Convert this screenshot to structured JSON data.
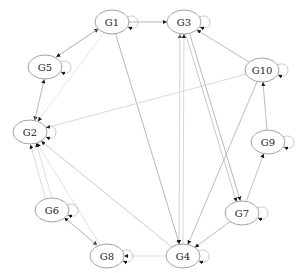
{
  "diagram": {
    "type": "directed-graph",
    "nodes": [
      {
        "id": "G1",
        "label": "G1",
        "x": 112,
        "y": 22
      },
      {
        "id": "G3",
        "label": "G3",
        "x": 184,
        "y": 22
      },
      {
        "id": "G5",
        "label": "G5",
        "x": 45,
        "y": 67
      },
      {
        "id": "G10",
        "label": "G10",
        "x": 262,
        "y": 70
      },
      {
        "id": "G2",
        "label": "G2",
        "x": 30,
        "y": 132
      },
      {
        "id": "G9",
        "label": "G9",
        "x": 268,
        "y": 142
      },
      {
        "id": "G6",
        "label": "G6",
        "x": 52,
        "y": 210
      },
      {
        "id": "G7",
        "label": "G7",
        "x": 242,
        "y": 213
      },
      {
        "id": "G8",
        "label": "G8",
        "x": 107,
        "y": 256
      },
      {
        "id": "G4",
        "label": "G4",
        "x": 183,
        "y": 256
      }
    ],
    "self_loops": [
      "G1",
      "G3",
      "G5",
      "G10",
      "G2",
      "G9",
      "G6",
      "G7",
      "G8",
      "G4"
    ],
    "edges": [
      {
        "from": "G1",
        "to": "G3",
        "color": "#9a9a9a",
        "offset": 0
      },
      {
        "from": "G5",
        "to": "G1",
        "color": "#b0b0b0",
        "offset": -2
      },
      {
        "from": "G1",
        "to": "G5",
        "color": "#b0b0b0",
        "offset": 2
      },
      {
        "from": "G1",
        "to": "G2",
        "color": "#d8d8d8",
        "offset": 0
      },
      {
        "from": "G1",
        "to": "G4",
        "color": "#9a9a9a",
        "offset": 0
      },
      {
        "from": "G5",
        "to": "G2",
        "color": "#b5b5b5",
        "offset": -2
      },
      {
        "from": "G2",
        "to": "G5",
        "color": "#c0c0c0",
        "offset": 2
      },
      {
        "from": "G10",
        "to": "G3",
        "color": "#a0a0a0",
        "offset": 0
      },
      {
        "from": "G10",
        "to": "G2",
        "color": "#c8c8c8",
        "offset": 0
      },
      {
        "from": "G10",
        "to": "G4",
        "color": "#a0a0a0",
        "offset": 0
      },
      {
        "from": "G9",
        "to": "G10",
        "color": "#a0a0a0",
        "offset": 0
      },
      {
        "from": "G7",
        "to": "G9",
        "color": "#a8a8a8",
        "offset": 0
      },
      {
        "from": "G3",
        "to": "G7",
        "color": "#9a9a9a",
        "offset": -2
      },
      {
        "from": "G3",
        "to": "G7",
        "color": "#b0b0b0",
        "offset": 2
      },
      {
        "from": "G7",
        "to": "G4",
        "color": "#9a9a9a",
        "offset": 0
      },
      {
        "from": "G4",
        "to": "G3",
        "color": "#d0d0d0",
        "offset": -4
      },
      {
        "from": "G4",
        "to": "G3",
        "color": "#c8c8c8",
        "offset": 0
      },
      {
        "from": "G3",
        "to": "G4",
        "color": "#d8d8d8",
        "offset": 4
      },
      {
        "from": "G6",
        "to": "G2",
        "color": "#c8c8c8",
        "offset": -3
      },
      {
        "from": "G6",
        "to": "G2",
        "color": "#d0d0d0",
        "offset": 3
      },
      {
        "from": "G8",
        "to": "G2",
        "color": "#d4d4d4",
        "offset": 0
      },
      {
        "from": "G4",
        "to": "G2",
        "color": "#b8b8b8",
        "offset": 0
      },
      {
        "from": "G6",
        "to": "G8",
        "color": "#a8a8a8",
        "offset": -2
      },
      {
        "from": "G8",
        "to": "G6",
        "color": "#c0c0c0",
        "offset": 2
      },
      {
        "from": "G4",
        "to": "G8",
        "color": "#d4d4d4",
        "offset": 0
      }
    ]
  }
}
